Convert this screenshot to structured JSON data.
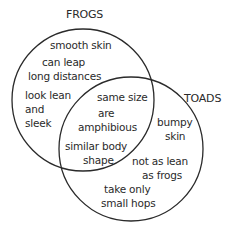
{
  "diagram": {
    "type": "venn",
    "sets": [
      {
        "name": "FROGS",
        "label": "FROGS"
      },
      {
        "name": "TOADS",
        "label": "TOADS"
      }
    ],
    "frogs_only": {
      "item0": "smooth skin",
      "item1_line0": "can leap",
      "item1_line1": "long distances",
      "item2_line0": "look lean",
      "item2_line1": "and",
      "item2_line2": "sleek"
    },
    "both": {
      "item0": "same size",
      "item1_line0": "are",
      "item1_line1": "amphibious",
      "item2_line0": "similar body",
      "item2_line1": "shape"
    },
    "toads_only": {
      "item0_line0": "bumpy",
      "item0_line1": "skin",
      "item1_line0": "not as lean",
      "item1_line1": "as frogs",
      "item2_line0": "take only",
      "item2_line1": "small hops"
    },
    "stroke_color": "#2a2a2a"
  }
}
